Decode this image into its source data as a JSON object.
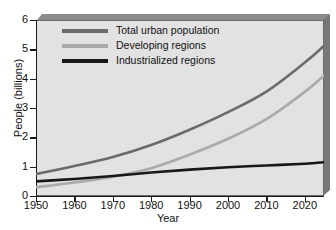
{
  "chart_data": {
    "type": "line",
    "title": "",
    "xlabel": "Year",
    "ylabel": "People (billions)",
    "xlim": [
      1950,
      2025
    ],
    "ylim": [
      0,
      6
    ],
    "grid": false,
    "legend_position": "top-left",
    "x_ticks": [
      "1950",
      "1960",
      "1970",
      "1980",
      "1990",
      "2000",
      "2010",
      "2020"
    ],
    "x_tick_values": [
      1950,
      1960,
      1970,
      1980,
      1990,
      2000,
      2010,
      2020
    ],
    "y_ticks": [
      "0",
      "1",
      "2",
      "3",
      "4",
      "5",
      "6"
    ],
    "y_tick_values": [
      0,
      1,
      2,
      3,
      4,
      5,
      6
    ],
    "x": [
      1950,
      1960,
      1970,
      1980,
      1990,
      2000,
      2010,
      2020,
      2025
    ],
    "series": [
      {
        "name": "Total urban population",
        "color": "#6b6b6b",
        "values": [
          0.75,
          1.02,
          1.33,
          1.74,
          2.26,
          2.86,
          3.56,
          4.55,
          5.12
        ]
      },
      {
        "name": "Developing regions",
        "color": "#aaaaaa",
        "values": [
          0.3,
          0.46,
          0.66,
          0.95,
          1.41,
          1.95,
          2.62,
          3.55,
          4.1
        ]
      },
      {
        "name": "Industrialized regions",
        "color": "#181818",
        "values": [
          0.5,
          0.58,
          0.68,
          0.8,
          0.9,
          0.98,
          1.04,
          1.1,
          1.15
        ]
      }
    ]
  },
  "style": {
    "plot_background": "#e2e2e2",
    "frame_color": "#6b6b6b",
    "bevel_top": "#8c8c8c",
    "bevel_right": "#787878",
    "axis_color": "#1a1a1a"
  }
}
